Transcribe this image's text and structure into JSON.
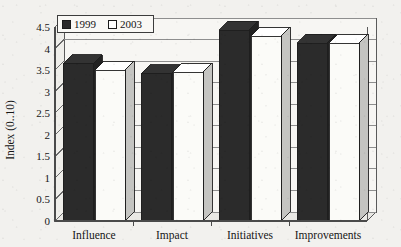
{
  "chart_data": {
    "type": "bar",
    "title": "",
    "subtitle": "",
    "xlabel": "",
    "ylabel": "Index (0..10)",
    "categories": [
      "Influence",
      "Impact",
      "Initiatives",
      "Improvements"
    ],
    "series": [
      {
        "name": "1999",
        "values": [
          3.65,
          3.42,
          4.42,
          4.12
        ],
        "color": "#2b2b2b"
      },
      {
        "name": "2003",
        "values": [
          3.5,
          3.45,
          4.28,
          4.12
        ],
        "color": "#fbfbf8"
      }
    ],
    "ylim": [
      0,
      4.5
    ],
    "ytick_step": 0.5,
    "ytick_labels": [
      "0",
      "0.5",
      "1",
      "1.5",
      "2",
      "2.5",
      "3",
      "3.5",
      "4",
      "4.5"
    ],
    "grid": true,
    "grid_axis": "y",
    "legend": {
      "position": "top-left",
      "entries": [
        "1999",
        "2003"
      ]
    },
    "style": "3d-grouped-bar",
    "annotations": []
  },
  "colors": {
    "page_background": "#f2f1ee",
    "plot_background": "#f7f6f3",
    "series_1999": "#2b2b2b",
    "series_2003": "#fbfbf8",
    "axis_line": "#4a4a4a",
    "grid_line": "#8e8e8e",
    "text": "#161616"
  },
  "legend": {
    "marker_1999": "filled-square-marker",
    "marker_2003": "empty-square-marker",
    "label_1999": "1999",
    "label_2003": "2003"
  },
  "axes": {
    "y_title": "Index (0..10)",
    "y_ticks": [
      "4.5",
      "4",
      "3.5",
      "3",
      "2.5",
      "2",
      "1.5",
      "1",
      "0.5",
      "0"
    ],
    "x_ticks": [
      "Influence",
      "Impact",
      "Initiatives",
      "Improvements"
    ]
  }
}
